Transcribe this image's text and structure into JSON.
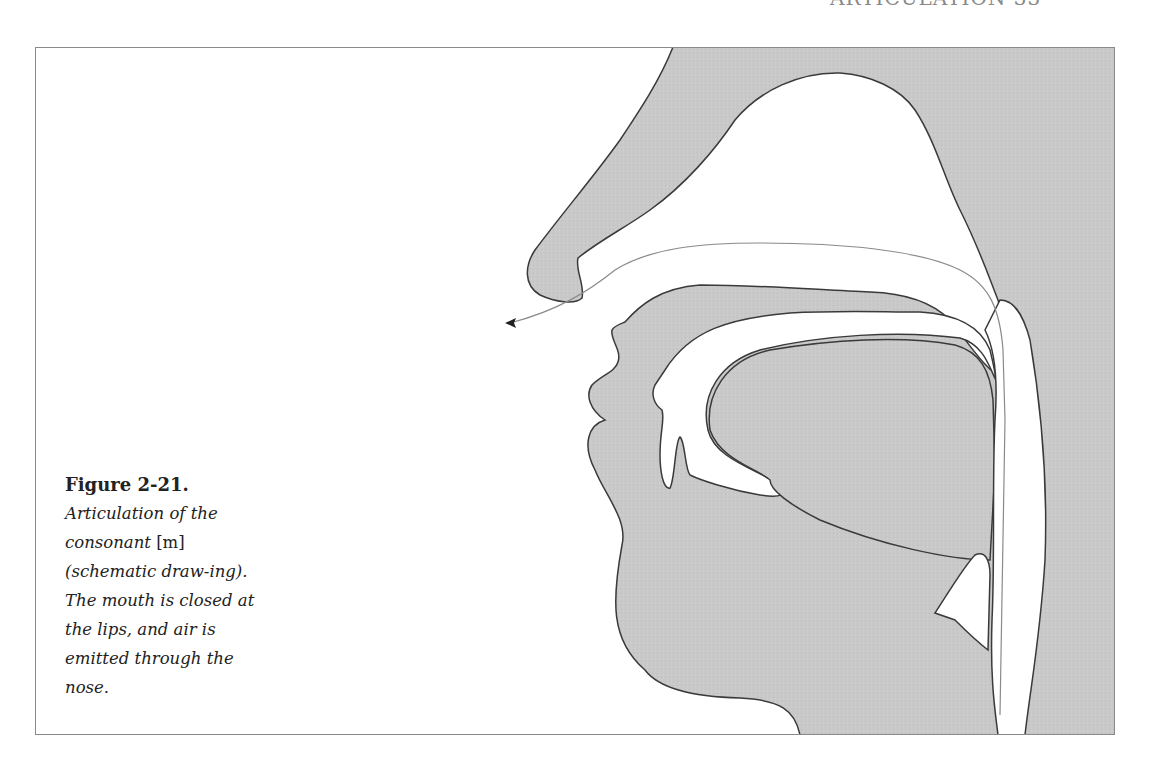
{
  "page": {
    "running_head": "ARTICULATION 33"
  },
  "figure": {
    "label": "Figure 2-21.",
    "caption_part1": "Articulation of the consonant ",
    "caption_phone": "[m]",
    "caption_part2": " (schematic draw-ing). The mouth is closed at the lips, and air is emitted through the nose.",
    "fill_color": "#c8c8c8",
    "outline_color": "#3a3a3a",
    "airflow_color": "#8a8a8a"
  }
}
